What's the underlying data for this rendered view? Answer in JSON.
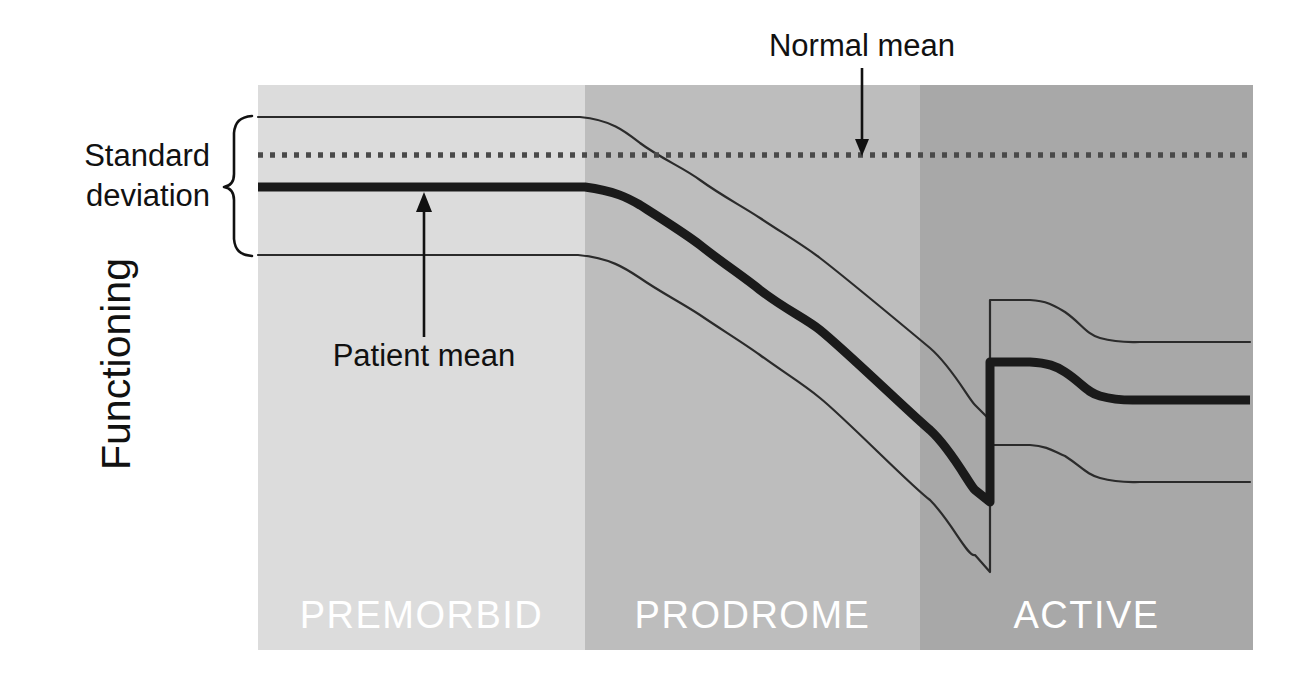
{
  "figure": {
    "axis_label_y": "Functioning",
    "annotations": {
      "normal_mean": "Normal mean",
      "standard_deviation_line1": "Standard",
      "standard_deviation_line2": "deviation",
      "patient_mean": "Patient mean"
    },
    "phases": [
      {
        "name": "PREMORBID",
        "label": "PREMORBID",
        "fill": "#dcdcdc",
        "x_start": 258,
        "x_end": 585
      },
      {
        "name": "PRODROME",
        "label": "PRODROME",
        "fill": "#bdbdbd",
        "x_start": 585,
        "x_end": 920
      },
      {
        "name": "ACTIVE",
        "label": "ACTIVE",
        "fill": "#a8a8a8",
        "x_start": 920,
        "x_end": 1253
      }
    ],
    "colors": {
      "patient_mean_line": "#1a1a1a",
      "sd_band_line": "#2b2b2b",
      "normal_mean_line": "#4a4a4a",
      "phase_label": "#ffffff",
      "background": "#ffffff"
    }
  },
  "chart_data": {
    "type": "line",
    "title": "",
    "subtitle": "",
    "xlabel": "",
    "ylabel": "Functioning",
    "grid": false,
    "legend_position": "annotations-inline",
    "x_axis": {
      "type": "categorical-phases",
      "categories": [
        "PREMORBID",
        "PRODROME",
        "ACTIVE"
      ],
      "range_px": [
        258,
        1253
      ],
      "phase_boundaries_px": [
        258,
        585,
        920,
        1253
      ]
    },
    "y_axis": {
      "label": "Functioning",
      "direction": "higher-is-better",
      "tick_labels": [],
      "range_px": [
        85,
        650
      ]
    },
    "annotations": [
      {
        "text": "Normal mean",
        "target": "normal-mean-line",
        "arrow": "down",
        "x_px": 862,
        "y_px": 155
      },
      {
        "text": "Standard deviation",
        "target": "sd-band-brace",
        "arrow": "brace",
        "y_top_px": 115,
        "y_bottom_px": 255
      },
      {
        "text": "Patient mean",
        "target": "patient-mean-line",
        "arrow": "up",
        "x_px": 424,
        "y_px": 190
      }
    ],
    "series": [
      {
        "name": "Normal mean",
        "style": "dotted",
        "description": "Constant reference level of normal functioning across all phases.",
        "points_px": [
          [
            258,
            155
          ],
          [
            1253,
            155
          ]
        ]
      },
      {
        "name": "Patient mean",
        "style": "thick-solid",
        "description": "Patient functioning: stable below normal during premorbid phase, gradual decline through prodrome, sharp drop at psychotic break, partial recovery then plateau in active phase.",
        "points_px": [
          [
            258,
            187
          ],
          [
            585,
            187
          ],
          [
            640,
            205
          ],
          [
            700,
            245
          ],
          [
            760,
            290
          ],
          [
            820,
            330
          ],
          [
            880,
            385
          ],
          [
            930,
            430
          ],
          [
            975,
            490
          ],
          [
            990,
            502
          ],
          [
            990,
            362
          ],
          [
            1030,
            362
          ],
          [
            1065,
            372
          ],
          [
            1100,
            396
          ],
          [
            1140,
            400
          ],
          [
            1253,
            400
          ]
        ]
      },
      {
        "name": "Patient mean + 1 SD",
        "style": "thin-solid",
        "description": "Upper standard deviation band around the patient mean.",
        "points_px": [
          [
            258,
            117
          ],
          [
            580,
            117
          ],
          [
            640,
            143
          ],
          [
            700,
            180
          ],
          [
            760,
            218
          ],
          [
            820,
            258
          ],
          [
            880,
            300
          ],
          [
            930,
            348
          ],
          [
            975,
            405
          ],
          [
            990,
            420
          ],
          [
            990,
            300
          ],
          [
            1030,
            300
          ],
          [
            1065,
            312
          ],
          [
            1100,
            338
          ],
          [
            1140,
            342
          ],
          [
            1253,
            342
          ]
        ]
      },
      {
        "name": "Patient mean - 1 SD",
        "style": "thin-solid",
        "description": "Lower standard deviation band around the patient mean.",
        "points_px": [
          [
            258,
            255
          ],
          [
            578,
            255
          ],
          [
            640,
            278
          ],
          [
            700,
            315
          ],
          [
            760,
            355
          ],
          [
            820,
            398
          ],
          [
            880,
            448
          ],
          [
            930,
            500
          ],
          [
            975,
            555
          ],
          [
            990,
            572
          ],
          [
            990,
            445
          ],
          [
            1030,
            445
          ],
          [
            1065,
            456
          ],
          [
            1100,
            478
          ],
          [
            1140,
            482
          ],
          [
            1253,
            482
          ]
        ]
      }
    ]
  }
}
